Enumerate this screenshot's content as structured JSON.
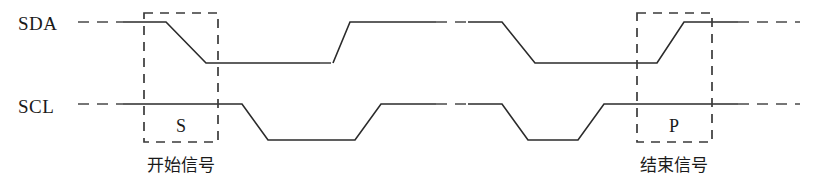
{
  "figure": {
    "type": "i2c-timing-diagram",
    "width": 817,
    "height": 188,
    "background_color": "#ffffff",
    "line_color": "#2b2b2b",
    "marker_box_color": "#3a3a3a"
  },
  "signals": {
    "sda": {
      "label": "SDA",
      "label_x": 18,
      "label_y": 30,
      "high_level_y": 22,
      "low_level_y": 63,
      "lead_dash": {
        "x1": 78,
        "x2": 123,
        "y": 22
      },
      "solid_path": "M 123,22 L 166,22 L 206,63 L 320,63",
      "mid_dash_low": {
        "x1": 320,
        "x2": 333,
        "y": 63
      },
      "pulse_path": "M 333,63 L 350,22 L 436,22",
      "top_dash": {
        "x1": 436,
        "x2": 468,
        "y": 22
      },
      "pulse_path2": "M 468,22 L 502,22 L 535,63 L 626,63",
      "rise_path": "M 626,63 L 657,63 L 684,22 L 738,22",
      "tail_dash": {
        "x1": 738,
        "x2": 800,
        "y": 22
      }
    },
    "scl": {
      "label": "SCL",
      "label_x": 18,
      "label_y": 113,
      "high_level_y": 104,
      "low_level_y": 140,
      "lead_dash": {
        "x1": 78,
        "x2": 123,
        "y": 104
      },
      "solid_path": "M 123,104 L 242,104 L 268,140 L 355,140 L 381,104 L 436,104",
      "top_dash": {
        "x1": 436,
        "x2": 468,
        "y": 104
      },
      "solid_path2": "M 468,104 L 502,104 L 528,140 L 578,140 L 604,104 L 738,104",
      "tail_dash": {
        "x1": 738,
        "x2": 800,
        "y": 104
      }
    }
  },
  "markers": [
    {
      "name": "start-condition",
      "symbol": "S",
      "caption": "开始信号",
      "box": {
        "x": 144,
        "y": 13,
        "width": 74,
        "height": 129
      },
      "symbol_x": 181,
      "symbol_y": 132,
      "caption_x": 181,
      "caption_y": 171
    },
    {
      "name": "stop-condition",
      "symbol": "P",
      "caption": "结束信号",
      "box": {
        "x": 637,
        "y": 13,
        "width": 75,
        "height": 129
      },
      "symbol_x": 674,
      "symbol_y": 132,
      "caption_x": 674,
      "caption_y": 171
    }
  ]
}
